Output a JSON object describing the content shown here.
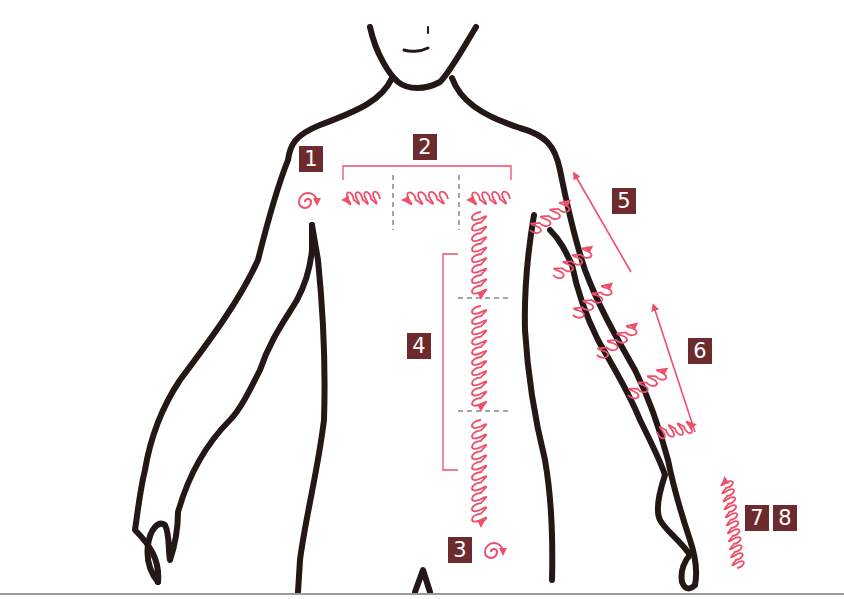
{
  "figure": {
    "type": "body-massage-diagram",
    "colors": {
      "outline": "#231815",
      "stroke": "#ee4f6a",
      "badge_bg": "#6e2b2e",
      "badge_text": "#ffffff",
      "divider": "#888888"
    },
    "steps": [
      {
        "id": "1",
        "label": "1",
        "region": "left-shoulder",
        "motion": "spiral"
      },
      {
        "id": "2",
        "label": "2",
        "region": "collarbone",
        "motion": "coil-leftward"
      },
      {
        "id": "3",
        "label": "3",
        "region": "lower-abdomen",
        "motion": "spiral"
      },
      {
        "id": "4",
        "label": "4",
        "region": "sternum-to-abdomen",
        "motion": "coil-downward"
      },
      {
        "id": "5",
        "label": "5",
        "region": "upper-arm",
        "motion": "coil-upward"
      },
      {
        "id": "6",
        "label": "6",
        "region": "forearm",
        "motion": "coil-upward"
      },
      {
        "id": "7",
        "label": "7",
        "region": "hand",
        "motion": "coil-upward"
      },
      {
        "id": "8",
        "label": "8",
        "region": "hand",
        "motion": "coil-upward"
      }
    ]
  }
}
